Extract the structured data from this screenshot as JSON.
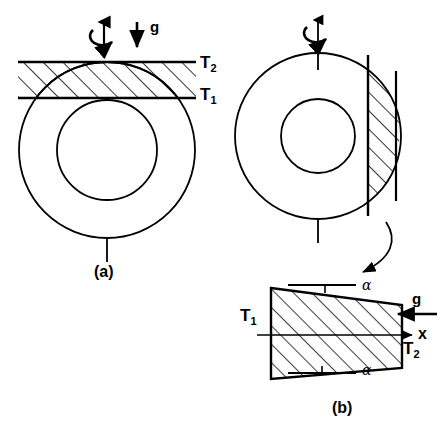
{
  "figure": {
    "background_color": "#ffffff",
    "line_color": "#000000",
    "width": 448,
    "height": 426
  },
  "panel_a": {
    "caption": "(a)",
    "temperature_outer_label": "T",
    "temperature_outer_sub": "2",
    "temperature_inner_label": "T",
    "temperature_inner_sub": "1",
    "gravity_label": "g",
    "rotation_axis_icon": "rotation-axis-arrow-icon",
    "gravity_arrow_icon": "gravity-down-arrow-icon",
    "shape": "concentric-annulus-with-hatched-band"
  },
  "panel_b": {
    "caption": "(b)",
    "rotation_axis_icon": "rotation-axis-arrow-icon",
    "shape": "concentric-annulus-with-hatched-vertical-slab",
    "leader_arrow_icon": "curved-leader-arrow-icon",
    "detail": {
      "gravity_label": "g",
      "gravity_arrow_icon": "gravity-left-arrow-icon",
      "axis_label": "x",
      "axis_arrow_icon": "x-axis-right-arrow-icon",
      "temperature_left_label": "T",
      "temperature_left_sub": "1",
      "temperature_right_label": "T",
      "temperature_right_sub": "2",
      "angle_top_label": "α",
      "angle_bottom_label": "α",
      "shape": "hatched-trapezoid-cross-section"
    }
  }
}
